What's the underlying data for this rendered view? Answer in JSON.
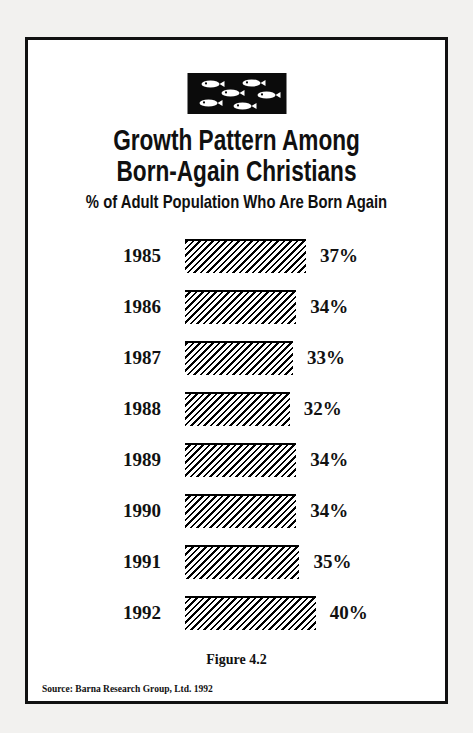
{
  "figure": {
    "logo_icon": "school-of-fish-icon",
    "title_line_1": "Growth Pattern Among",
    "title_line_2": "Born-Again Christians",
    "subtitle": "% of Adult Population Who Are Born Again",
    "caption": "Figure 4.2",
    "source": "Source: Barna Research Group, Ltd. 1992",
    "border_color": "#111111",
    "bar_color": "#000000",
    "page_background": "#f2f1ef"
  },
  "chart_data": {
    "type": "bar",
    "orientation": "horizontal",
    "title": "Growth Pattern Among Born-Again Christians",
    "subtitle": "% of Adult Population Who Are Born Again",
    "xlabel": "",
    "ylabel": "",
    "xlim": [
      0,
      40
    ],
    "grid": false,
    "legend": null,
    "categories": [
      "1985",
      "1986",
      "1987",
      "1988",
      "1989",
      "1990",
      "1991",
      "1992"
    ],
    "values": [
      37,
      34,
      33,
      32,
      34,
      34,
      35,
      40
    ],
    "value_labels": [
      "37%",
      "34%",
      "33%",
      "32%",
      "34%",
      "34%",
      "35%",
      "40%"
    ],
    "source": "Barna Research Group, Ltd. 1992"
  }
}
